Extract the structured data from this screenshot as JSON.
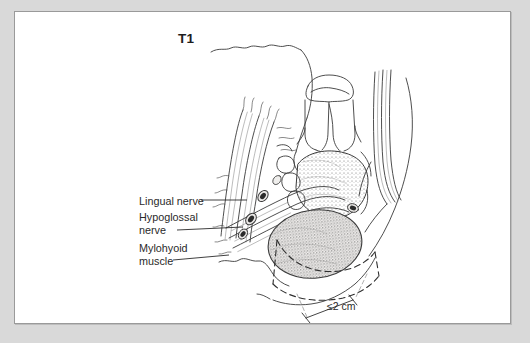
{
  "figure": {
    "name": "floor-of-mouth-T1-tumor-coronal-section",
    "stage_label": "T1",
    "background_color": "#d9d9d9",
    "panel_color": "#ffffff",
    "border_color": "#9a9a9a",
    "ink_color": "#3a3a3a",
    "text_color": "#2a2a2a"
  },
  "annotations": [
    {
      "key": "lingual",
      "label": "Lingual nerve",
      "leader": true
    },
    {
      "key": "hypoglossal",
      "label": "Hypoglossal\nnerve",
      "leader": true
    },
    {
      "key": "mylohyoid",
      "label": "Mylohyoid\nmuscle",
      "leader": true
    }
  ],
  "measurement": {
    "label": "≤2 cm",
    "value": 2,
    "unit": "cm",
    "comparator": "≤",
    "style": "dimension-line-with-ticks"
  },
  "structures": [
    {
      "name": "skin-and-chin-contour",
      "style": "outline"
    },
    {
      "name": "mandible-tooth-crown",
      "style": "outline"
    },
    {
      "name": "mandible-bone-marrow",
      "style": "stipple"
    },
    {
      "name": "tumor-mass",
      "style": "dense-stipple"
    },
    {
      "name": "genioglossus-muscle-fibers",
      "style": "striations"
    },
    {
      "name": "mylohyoid-muscle-fibers",
      "style": "striations"
    },
    {
      "name": "lingual-nerve-cross-section",
      "style": "dark-ellipse"
    },
    {
      "name": "hypoglossal-nerve-cross-section",
      "style": "dark-ellipse"
    },
    {
      "name": "resection-margin",
      "style": "dashed"
    }
  ]
}
